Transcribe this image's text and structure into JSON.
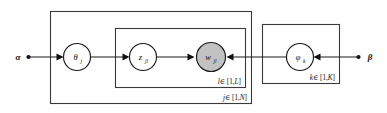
{
  "diagram": {
    "type": "plate-notation-graphical-model",
    "title": "",
    "background_color": "#ffffff",
    "stroke_color": "#1a1a1a",
    "plate_stroke_color": "#3a3a3a",
    "observed_fill_color": "#c2c2c2",
    "latent_fill_color": "#ffffff",
    "hyperparameters": [
      {
        "id": "alpha",
        "symbol": "α",
        "position": "left",
        "has_dot": true
      },
      {
        "id": "beta",
        "symbol": "β",
        "position": "right",
        "has_dot": true
      }
    ],
    "nodes": [
      {
        "id": "theta",
        "symbol": "θ",
        "subscript": "j",
        "shaded": false,
        "kind": "latent-variable"
      },
      {
        "id": "z",
        "symbol": "z",
        "subscript": "jl",
        "shaded": false,
        "kind": "latent-variable"
      },
      {
        "id": "w",
        "symbol": "w",
        "subscript": "jl",
        "shaded": true,
        "kind": "observed-variable"
      },
      {
        "id": "phi",
        "symbol": "φ",
        "subscript": "k",
        "shaded": false,
        "kind": "latent-variable"
      }
    ],
    "plates": [
      {
        "id": "plate-j",
        "label_index": "j",
        "label_member": "∈ [1,",
        "label_bound": "N",
        "label_close": "]",
        "label_full": "j∈ [1,N]"
      },
      {
        "id": "plate-l",
        "label_index": "l",
        "label_member": "∈ [1,",
        "label_bound": "L",
        "label_close": "]",
        "label_full": "l∈ [1,L]"
      },
      {
        "id": "plate-k",
        "label_index": "k",
        "label_member": "∈ [1,",
        "label_bound": "K",
        "label_close": "]",
        "label_full": "k∈ [1,K]"
      }
    ],
    "edges": [
      {
        "id": "alpha-to-theta",
        "from": "alpha",
        "to": "theta",
        "direction": "right"
      },
      {
        "id": "theta-to-z",
        "from": "theta",
        "to": "z",
        "direction": "right"
      },
      {
        "id": "z-to-w",
        "from": "z",
        "to": "w",
        "direction": "right"
      },
      {
        "id": "phi-to-w",
        "from": "phi",
        "to": "w",
        "direction": "left"
      },
      {
        "id": "beta-to-phi",
        "from": "beta",
        "to": "phi",
        "direction": "left"
      }
    ]
  }
}
